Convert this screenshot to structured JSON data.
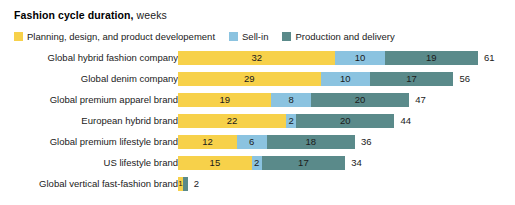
{
  "header": {
    "title_main": "Fashion cycle duration,",
    "title_sub": " weeks"
  },
  "legend": {
    "items": [
      {
        "label": "Planning, design, and product developement",
        "color": "#F7D14A",
        "key": "planning"
      },
      {
        "label": "Sell-in",
        "color": "#8BC3E0",
        "key": "sell-in"
      },
      {
        "label": "Production and delivery",
        "color": "#5A8A8A",
        "key": "production"
      }
    ]
  },
  "chart_data": {
    "type": "bar",
    "orientation": "horizontal",
    "stacked": true,
    "title": "Fashion cycle duration, weeks",
    "xlabel": "",
    "ylabel": "",
    "unit": "weeks",
    "grid": false,
    "legend_position": "top",
    "xlim": [
      0,
      61
    ],
    "categories": [
      "Global hybrid fashion company",
      "Global denim company",
      "Global premium apparel brand",
      "European hybrid brand",
      "Global premium lifestyle brand",
      "US lifestyle brand",
      "Global vertical fast-fashion brand"
    ],
    "series": [
      {
        "name": "Planning, design, and product developement",
        "color": "#F7D14A",
        "values": [
          32,
          29,
          19,
          22,
          12,
          15,
          1
        ]
      },
      {
        "name": "Sell-in",
        "color": "#8BC3E0",
        "values": [
          10,
          10,
          8,
          2,
          6,
          2,
          0
        ]
      },
      {
        "name": "Production and delivery",
        "color": "#5A8A8A",
        "values": [
          19,
          17,
          20,
          20,
          18,
          17,
          1
        ]
      }
    ],
    "totals": [
      61,
      56,
      47,
      44,
      36,
      34,
      2
    ],
    "segment_labels": [
      [
        "32",
        "10",
        "19"
      ],
      [
        "29",
        "10",
        "17"
      ],
      [
        "19",
        "8",
        "20"
      ],
      [
        "22",
        "2",
        "20"
      ],
      [
        "12",
        "6",
        "18"
      ],
      [
        "15",
        "2",
        "17"
      ],
      [
        "1",
        "",
        ""
      ]
    ],
    "total_labels": [
      "61",
      "56",
      "47",
      "44",
      "36",
      "34",
      "2"
    ]
  }
}
